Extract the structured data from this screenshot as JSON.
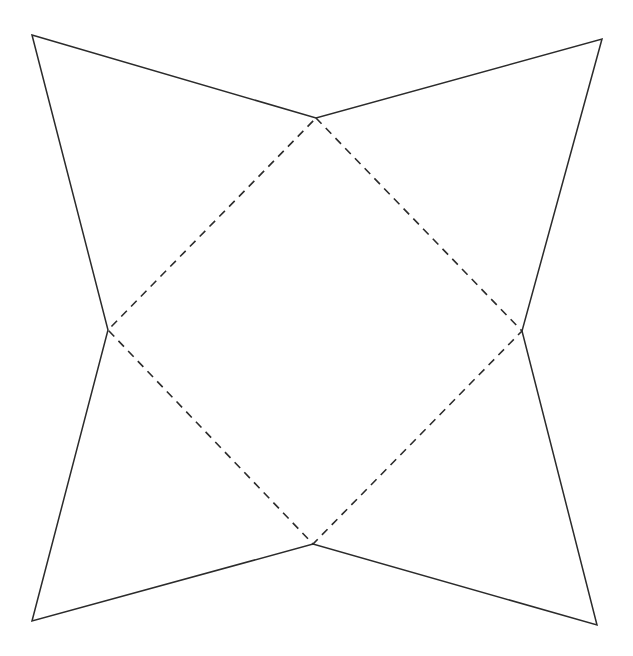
{
  "document": {
    "title": "Four-pointed concave star with inscribed dashed rhombus",
    "background_color": "#ffffff",
    "width": 633,
    "height": 656
  },
  "style": {
    "solid_stroke_color": "#2b2b2b",
    "solid_stroke_width": 1.5,
    "dashed_stroke_color": "#2b2b2b",
    "dashed_stroke_width": 1.6,
    "dash_length": 8,
    "dash_gap": 6
  },
  "figure": {
    "name": "four-pointed-star",
    "outer_points": [
      {
        "label": "top-left-point",
        "x": 32,
        "y": 35
      },
      {
        "label": "top-right-point",
        "x": 602,
        "y": 39
      },
      {
        "label": "bottom-right-point",
        "x": 597,
        "y": 625
      },
      {
        "label": "bottom-left-point",
        "x": 32,
        "y": 621
      }
    ],
    "inner_points": [
      {
        "label": "top-inner-vertex",
        "x": 316,
        "y": 118
      },
      {
        "label": "right-inner-vertex",
        "x": 522,
        "y": 331
      },
      {
        "label": "bottom-inner-vertex",
        "x": 313,
        "y": 544
      },
      {
        "label": "left-inner-vertex",
        "x": 108,
        "y": 330
      }
    ],
    "star_outline_path": "M 32 35 L 316 118 L 602 39 L 522 331 L 597 625 L 313 544 L 32 621 L 108 330 Z",
    "inner_rhombus_path": "M 316 118 L 522 331 L 313 544 L 108 330 Z",
    "solid_segments": [
      {
        "name": "segment-tl-to-top-inner",
        "from": "top-left-point",
        "to": "top-inner-vertex"
      },
      {
        "name": "segment-top-inner-to-tr",
        "from": "top-inner-vertex",
        "to": "top-right-point"
      },
      {
        "name": "segment-tr-to-right-inner",
        "from": "top-right-point",
        "to": "right-inner-vertex"
      },
      {
        "name": "segment-right-inner-to-br",
        "from": "right-inner-vertex",
        "to": "bottom-right-point"
      },
      {
        "name": "segment-br-to-bottom-inner",
        "from": "bottom-right-point",
        "to": "bottom-inner-vertex"
      },
      {
        "name": "segment-bottom-inner-to-bl",
        "from": "bottom-inner-vertex",
        "to": "bottom-left-point"
      },
      {
        "name": "segment-bl-to-left-inner",
        "from": "bottom-left-point",
        "to": "left-inner-vertex"
      },
      {
        "name": "segment-left-inner-to-tl",
        "from": "left-inner-vertex",
        "to": "top-left-point"
      }
    ],
    "dashed_segments": [
      {
        "name": "dashed-top-to-right",
        "from": "top-inner-vertex",
        "to": "right-inner-vertex"
      },
      {
        "name": "dashed-right-to-bottom",
        "from": "right-inner-vertex",
        "to": "bottom-inner-vertex"
      },
      {
        "name": "dashed-bottom-to-left",
        "from": "bottom-inner-vertex",
        "to": "left-inner-vertex"
      },
      {
        "name": "dashed-left-to-top",
        "from": "left-inner-vertex",
        "to": "top-inner-vertex"
      }
    ]
  }
}
